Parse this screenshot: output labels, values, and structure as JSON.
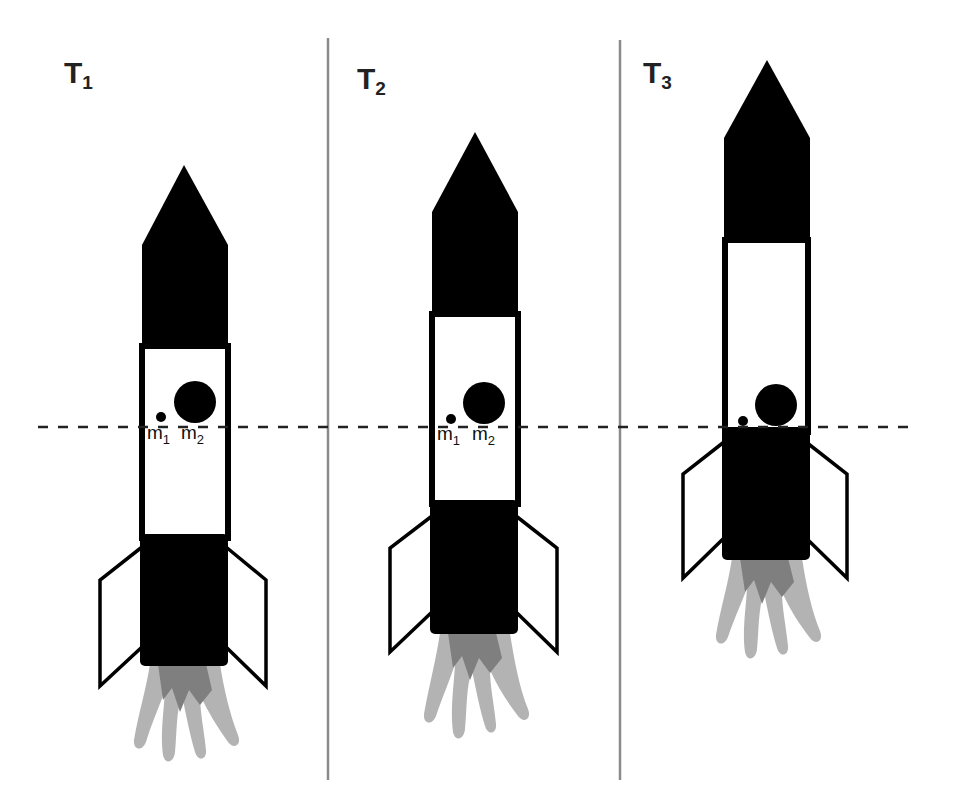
{
  "diagram": {
    "colors": {
      "background": "#ffffff",
      "rocket_body": "#000000",
      "window": "#ffffff",
      "flame_outer": "#b3b3b3",
      "flame_inner": "#7f7f7f",
      "divider": "#8a8a8a",
      "reference_line": "#222222"
    },
    "reference_line": {
      "style": "dashed",
      "y": 427
    },
    "panels": [
      {
        "label_main": "T",
        "label_sub": "1",
        "masses": [
          {
            "label_main": "m",
            "label_sub": "1",
            "size": "small"
          },
          {
            "label_main": "m",
            "label_sub": "2",
            "size": "large"
          }
        ]
      },
      {
        "label_main": "T",
        "label_sub": "2",
        "masses": [
          {
            "label_main": "m",
            "label_sub": "1",
            "size": "small"
          },
          {
            "label_main": "m",
            "label_sub": "2",
            "size": "large"
          }
        ]
      },
      {
        "label_main": "T",
        "label_sub": "3",
        "masses": [
          {
            "label_main": "",
            "label_sub": "",
            "size": "small"
          },
          {
            "label_main": "",
            "label_sub": "",
            "size": "large"
          }
        ]
      }
    ]
  }
}
